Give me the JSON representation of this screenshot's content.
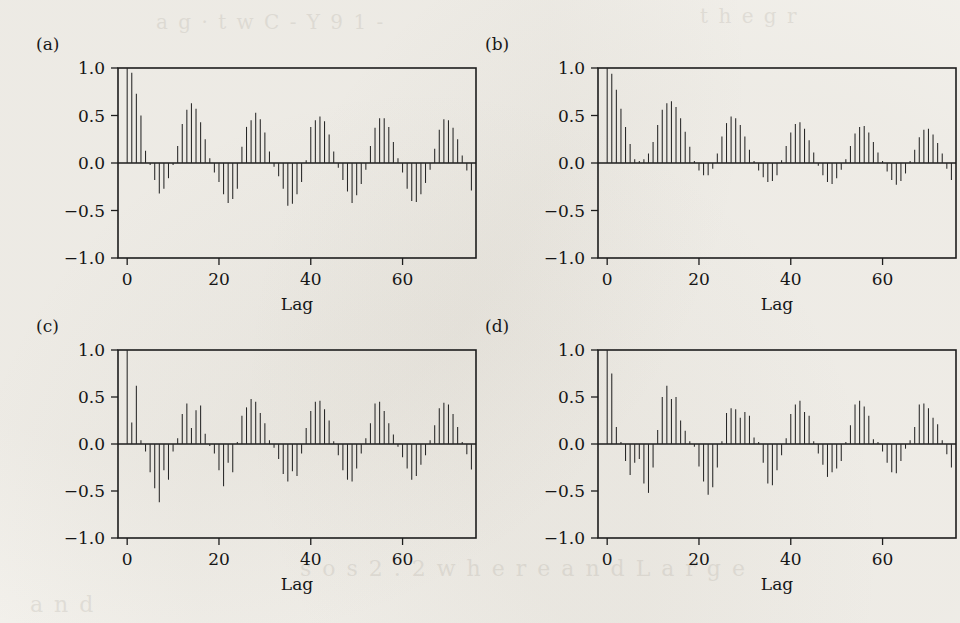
{
  "figure": {
    "background_color": "#f3f1ec",
    "ink_color": "#1d1d1d",
    "panel_labels": [
      "(a)",
      "(b)",
      "(c)",
      "(d)"
    ],
    "bleed_through_text": [
      "a  g ·  t w C  -  Y 9  1 -",
      "(b)",
      "t h e g r",
      "a n d",
      "s o s  2 . 2  w h e r e  a n d  L a r g e"
    ]
  },
  "axes_common": {
    "xlabel": "Lag",
    "ylabel": "",
    "xticks": [
      0,
      20,
      40,
      60
    ],
    "xticklabels": [
      "0",
      "20",
      "40",
      "60"
    ],
    "yticks": [
      -1.0,
      -0.5,
      0.0,
      0.5,
      1.0
    ],
    "yticklabels": [
      "−1.0",
      "−0.5",
      "0.0",
      "0.5",
      "1.0"
    ],
    "xlim": [
      -2,
      76
    ],
    "ylim": [
      -1.0,
      1.0
    ],
    "grid": false,
    "legend": "none"
  },
  "chart_data": [
    {
      "type": "bar",
      "panel": "(a)",
      "title": "(a)",
      "xlabel": "Lag",
      "ylabel": "",
      "xlim": [
        -2,
        76
      ],
      "ylim": [
        -1.0,
        1.0
      ],
      "xticks": [
        0,
        20,
        40,
        60
      ],
      "yticks": [
        -1.0,
        -0.5,
        0.0,
        0.5,
        1.0
      ],
      "grid": false,
      "x": [
        0,
        1,
        2,
        3,
        4,
        5,
        6,
        7,
        8,
        9,
        10,
        11,
        12,
        13,
        14,
        15,
        16,
        17,
        18,
        19,
        20,
        21,
        22,
        23,
        24,
        25,
        26,
        27,
        28,
        29,
        30,
        31,
        32,
        33,
        34,
        35,
        36,
        37,
        38,
        39,
        40,
        41,
        42,
        43,
        44,
        45,
        46,
        47,
        48,
        49,
        50,
        51,
        52,
        53,
        54,
        55,
        56,
        57,
        58,
        59,
        60,
        61,
        62,
        63,
        64,
        65,
        66,
        67,
        68,
        69,
        70,
        71,
        72,
        73,
        74,
        75
      ],
      "values": [
        1.0,
        0.95,
        0.73,
        0.5,
        0.13,
        -0.02,
        -0.18,
        -0.32,
        -0.27,
        -0.16,
        -0.02,
        0.18,
        0.41,
        0.56,
        0.63,
        0.57,
        0.43,
        0.25,
        0.05,
        -0.1,
        -0.2,
        -0.33,
        -0.42,
        -0.38,
        -0.27,
        0.17,
        0.38,
        0.45,
        0.53,
        0.46,
        0.32,
        0.12,
        -0.04,
        -0.14,
        -0.27,
        -0.45,
        -0.43,
        -0.33,
        -0.2,
        0.03,
        0.38,
        0.45,
        0.49,
        0.44,
        0.3,
        0.12,
        -0.05,
        -0.18,
        -0.3,
        -0.42,
        -0.34,
        -0.22,
        -0.07,
        0.18,
        0.37,
        0.47,
        0.47,
        0.38,
        0.22,
        0.05,
        -0.1,
        -0.27,
        -0.4,
        -0.41,
        -0.33,
        -0.21,
        -0.07,
        0.15,
        0.35,
        0.46,
        0.45,
        0.37,
        0.25,
        0.08,
        -0.08,
        -0.29
      ]
    },
    {
      "type": "bar",
      "panel": "(b)",
      "title": "(b)",
      "xlabel": "Lag",
      "ylabel": "",
      "xlim": [
        -2,
        76
      ],
      "ylim": [
        -1.0,
        1.0
      ],
      "xticks": [
        0,
        20,
        40,
        60
      ],
      "yticks": [
        -1.0,
        -0.5,
        0.0,
        0.5,
        1.0
      ],
      "grid": false,
      "x": [
        0,
        1,
        2,
        3,
        4,
        5,
        6,
        7,
        8,
        9,
        10,
        11,
        12,
        13,
        14,
        15,
        16,
        17,
        18,
        19,
        20,
        21,
        22,
        23,
        24,
        25,
        26,
        27,
        28,
        29,
        30,
        31,
        32,
        33,
        34,
        35,
        36,
        37,
        38,
        39,
        40,
        41,
        42,
        43,
        44,
        45,
        46,
        47,
        48,
        49,
        50,
        51,
        52,
        53,
        54,
        55,
        56,
        57,
        58,
        59,
        60,
        61,
        62,
        63,
        64,
        65,
        66,
        67,
        68,
        69,
        70,
        71,
        72,
        73,
        74,
        75
      ],
      "values": [
        1.0,
        0.94,
        0.77,
        0.57,
        0.38,
        0.2,
        0.04,
        0.02,
        0.04,
        0.1,
        0.22,
        0.4,
        0.56,
        0.63,
        0.65,
        0.59,
        0.47,
        0.33,
        0.17,
        0.02,
        -0.08,
        -0.13,
        -0.13,
        -0.06,
        0.1,
        0.28,
        0.42,
        0.49,
        0.47,
        0.4,
        0.28,
        0.14,
        0.02,
        -0.08,
        -0.15,
        -0.2,
        -0.19,
        -0.13,
        0.03,
        0.18,
        0.32,
        0.41,
        0.43,
        0.36,
        0.24,
        0.11,
        -0.03,
        -0.13,
        -0.2,
        -0.22,
        -0.16,
        -0.07,
        0.04,
        0.18,
        0.31,
        0.38,
        0.39,
        0.32,
        0.22,
        0.11,
        0.02,
        -0.09,
        -0.18,
        -0.23,
        -0.19,
        -0.11,
        0.02,
        0.14,
        0.27,
        0.35,
        0.36,
        0.3,
        0.21,
        0.1,
        -0.06,
        -0.18
      ]
    },
    {
      "type": "bar",
      "panel": "(c)",
      "title": "(c)",
      "xlabel": "Lag",
      "ylabel": "",
      "xlim": [
        -2,
        76
      ],
      "ylim": [
        -1.0,
        1.0
      ],
      "xticks": [
        0,
        20,
        40,
        60
      ],
      "yticks": [
        -1.0,
        -0.5,
        0.0,
        0.5,
        1.0
      ],
      "grid": false,
      "x": [
        0,
        1,
        2,
        3,
        4,
        5,
        6,
        7,
        8,
        9,
        10,
        11,
        12,
        13,
        14,
        15,
        16,
        17,
        18,
        19,
        20,
        21,
        22,
        23,
        24,
        25,
        26,
        27,
        28,
        29,
        30,
        31,
        32,
        33,
        34,
        35,
        36,
        37,
        38,
        39,
        40,
        41,
        42,
        43,
        44,
        45,
        46,
        47,
        48,
        49,
        50,
        51,
        52,
        53,
        54,
        55,
        56,
        57,
        58,
        59,
        60,
        61,
        62,
        63,
        64,
        65,
        66,
        67,
        68,
        69,
        70,
        71,
        72,
        73,
        74,
        75
      ],
      "values": [
        1.0,
        0.23,
        0.62,
        0.04,
        -0.08,
        -0.3,
        -0.47,
        -0.62,
        -0.28,
        -0.38,
        -0.08,
        0.06,
        0.32,
        0.43,
        0.17,
        0.36,
        0.41,
        0.11,
        -0.02,
        -0.1,
        -0.28,
        -0.45,
        -0.2,
        -0.3,
        0.02,
        0.3,
        0.39,
        0.48,
        0.45,
        0.33,
        0.22,
        0.04,
        -0.04,
        -0.16,
        -0.32,
        -0.4,
        -0.29,
        -0.34,
        -0.1,
        0.17,
        0.35,
        0.45,
        0.46,
        0.37,
        0.25,
        0.03,
        -0.12,
        -0.28,
        -0.38,
        -0.4,
        -0.26,
        -0.1,
        0.06,
        0.22,
        0.43,
        0.45,
        0.35,
        0.22,
        0.1,
        -0.03,
        -0.14,
        -0.26,
        -0.38,
        -0.34,
        -0.22,
        -0.12,
        0.04,
        0.2,
        0.38,
        0.44,
        0.42,
        0.32,
        0.18,
        0.02,
        -0.11,
        -0.27
      ]
    },
    {
      "type": "bar",
      "panel": "(d)",
      "title": "(d)",
      "xlabel": "Lag",
      "ylabel": "",
      "xlim": [
        -2,
        76
      ],
      "ylim": [
        -1.0,
        1.0
      ],
      "xticks": [
        0,
        20,
        40,
        60
      ],
      "yticks": [
        -1.0,
        -0.5,
        0.0,
        0.5,
        1.0
      ],
      "grid": false,
      "x": [
        0,
        1,
        2,
        3,
        4,
        5,
        6,
        7,
        8,
        9,
        10,
        11,
        12,
        13,
        14,
        15,
        16,
        17,
        18,
        19,
        20,
        21,
        22,
        23,
        24,
        25,
        26,
        27,
        28,
        29,
        30,
        31,
        32,
        33,
        34,
        35,
        36,
        37,
        38,
        39,
        40,
        41,
        42,
        43,
        44,
        45,
        46,
        47,
        48,
        49,
        50,
        51,
        52,
        53,
        54,
        55,
        56,
        57,
        58,
        59,
        60,
        61,
        62,
        63,
        64,
        65,
        66,
        67,
        68,
        69,
        70,
        71,
        72,
        73,
        74,
        75
      ],
      "values": [
        1.0,
        0.75,
        0.18,
        0.02,
        -0.18,
        -0.33,
        -0.2,
        -0.16,
        -0.42,
        -0.52,
        -0.25,
        0.15,
        0.5,
        0.62,
        0.48,
        0.5,
        0.25,
        0.14,
        0.03,
        -0.03,
        -0.24,
        -0.4,
        -0.54,
        -0.46,
        -0.25,
        0.03,
        0.33,
        0.38,
        0.37,
        0.28,
        0.34,
        0.3,
        0.07,
        0.02,
        -0.2,
        -0.42,
        -0.44,
        -0.28,
        -0.12,
        0.06,
        0.32,
        0.42,
        0.46,
        0.34,
        0.3,
        0.03,
        -0.1,
        -0.22,
        -0.35,
        -0.3,
        -0.26,
        -0.18,
        0.02,
        0.2,
        0.42,
        0.46,
        0.4,
        0.3,
        0.05,
        0.02,
        -0.08,
        -0.2,
        -0.3,
        -0.31,
        -0.18,
        -0.05,
        0.04,
        0.18,
        0.42,
        0.43,
        0.38,
        0.28,
        0.21,
        0.04,
        -0.11,
        -0.25
      ]
    }
  ]
}
